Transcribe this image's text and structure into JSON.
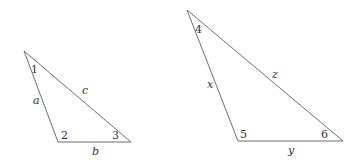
{
  "diagram": {
    "stroke_color": "#6f6f6f",
    "text_color": "#333333",
    "triangles": [
      {
        "name": "triangle-abc",
        "vertices": {
          "top": [
            24,
            51
          ],
          "bottom_left": [
            58,
            142
          ],
          "bottom_right": [
            131,
            142
          ]
        },
        "angles": [
          {
            "label": "1",
            "pos": [
              31,
              73
            ]
          },
          {
            "label": "2",
            "pos": [
              61,
              139
            ]
          },
          {
            "label": "3",
            "pos": [
              112,
              139
            ]
          }
        ],
        "sides": [
          {
            "label": "a",
            "pos": [
              33,
              104
            ]
          },
          {
            "label": "c",
            "pos": [
              82,
              94
            ]
          },
          {
            "label": "b",
            "pos": [
              92,
              155
            ]
          }
        ]
      },
      {
        "name": "triangle-xyz",
        "vertices": {
          "top": [
            187,
            10
          ],
          "bottom_left": [
            238,
            141
          ],
          "bottom_right": [
            343,
            141
          ]
        },
        "angles": [
          {
            "label": "4",
            "pos": [
              195,
              33
            ]
          },
          {
            "label": "5",
            "pos": [
              240,
              138
            ]
          },
          {
            "label": "6",
            "pos": [
              321,
              138
            ]
          }
        ],
        "sides": [
          {
            "label": "x",
            "pos": [
              207,
              88
            ]
          },
          {
            "label": "z",
            "pos": [
              272,
              78
            ]
          },
          {
            "label": "y",
            "pos": [
              288,
              154
            ]
          }
        ]
      }
    ]
  }
}
